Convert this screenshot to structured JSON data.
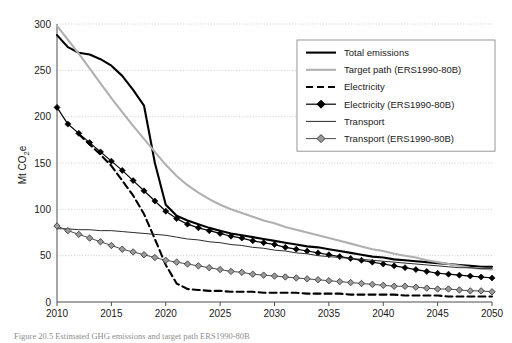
{
  "figure": {
    "caption": "Figure 20.5   Estimated GHG emissions and target path ERS1990-80B"
  },
  "chart_data": {
    "type": "line",
    "title": "",
    "xlabel": "",
    "ylabel": "Mt CO2e",
    "ylabel_display": "Mt CO",
    "ylabel_sub": "2",
    "ylabel_tail": "e",
    "xlim": [
      2010,
      2050
    ],
    "ylim": [
      0,
      300
    ],
    "yticks": [
      0,
      50,
      100,
      150,
      200,
      250,
      300
    ],
    "xticks": [
      2010,
      2015,
      2020,
      2025,
      2030,
      2035,
      2040,
      2045,
      2050
    ],
    "grid": "horizontal-dotted",
    "legend_position": "top-right",
    "colors": {
      "total_emissions": "#000000",
      "target_path": "#b0b0b0",
      "electricity": "#000000",
      "electricity_ers": "#000000",
      "transport": "#2b2b2b",
      "transport_ers": "#808080",
      "gridline": "#bfbfbf",
      "axis": "#4d4d4d",
      "legend_border": "#8c8c8c"
    },
    "series": [
      {
        "name": "Total emissions",
        "style": "solid-thick",
        "color": "#000000",
        "x": [
          2010,
          2011,
          2012,
          2013,
          2014,
          2015,
          2016,
          2017,
          2018,
          2019,
          2020,
          2021,
          2022,
          2023,
          2024,
          2025,
          2026,
          2027,
          2028,
          2029,
          2030,
          2031,
          2032,
          2033,
          2034,
          2035,
          2036,
          2037,
          2038,
          2039,
          2040,
          2041,
          2042,
          2043,
          2044,
          2045,
          2046,
          2047,
          2048,
          2049,
          2050
        ],
        "values": [
          288,
          275,
          269,
          267,
          262,
          255,
          244,
          229,
          212,
          150,
          105,
          93,
          88,
          84,
          80,
          77,
          74,
          72,
          70,
          68,
          66,
          64,
          62,
          60,
          59,
          57,
          55,
          53,
          51,
          49,
          48,
          46,
          45,
          44,
          43,
          42,
          41,
          40,
          39,
          38,
          38
        ]
      },
      {
        "name": "Target path (ERS1990-80B)",
        "style": "solid-thick",
        "color": "#b0b0b0",
        "x": [
          2010,
          2011,
          2012,
          2013,
          2014,
          2015,
          2016,
          2017,
          2018,
          2019,
          2020,
          2021,
          2022,
          2023,
          2024,
          2025,
          2026,
          2027,
          2028,
          2029,
          2030,
          2031,
          2032,
          2033,
          2034,
          2035,
          2036,
          2037,
          2038,
          2039,
          2040,
          2041,
          2042,
          2043,
          2044,
          2045,
          2046,
          2047,
          2048,
          2049,
          2050
        ],
        "values": [
          298,
          283,
          268,
          252,
          236,
          220,
          205,
          190,
          176,
          162,
          148,
          136,
          126,
          118,
          111,
          105,
          100,
          96,
          92,
          88,
          85,
          81,
          78,
          75,
          72,
          69,
          66,
          63,
          60,
          57,
          55,
          52,
          50,
          48,
          45,
          43,
          41,
          39,
          37,
          36,
          35
        ]
      },
      {
        "name": "Electricity",
        "style": "dashed",
        "color": "#000000",
        "x": [
          2012,
          2013,
          2014,
          2015,
          2016,
          2017,
          2018,
          2019,
          2020,
          2021,
          2022,
          2023,
          2024,
          2025,
          2026,
          2027,
          2028,
          2029,
          2030,
          2031,
          2032,
          2033,
          2034,
          2035,
          2036,
          2037,
          2038,
          2039,
          2040,
          2041,
          2042,
          2043,
          2044,
          2045,
          2046,
          2047,
          2048,
          2049,
          2050
        ],
        "values": [
          181,
          170,
          159,
          147,
          131,
          115,
          95,
          68,
          40,
          20,
          14,
          13,
          12,
          12,
          11,
          11,
          11,
          10,
          10,
          10,
          10,
          9,
          9,
          9,
          9,
          8,
          8,
          8,
          8,
          8,
          7,
          7,
          7,
          7,
          6,
          6,
          6,
          6,
          6
        ]
      },
      {
        "name": "Electricity (ERS1990-80B)",
        "style": "solid-marker-diamond-black",
        "color": "#000000",
        "x": [
          2010,
          2011,
          2012,
          2013,
          2014,
          2015,
          2016,
          2017,
          2018,
          2019,
          2020,
          2021,
          2022,
          2023,
          2024,
          2025,
          2026,
          2027,
          2028,
          2029,
          2030,
          2031,
          2032,
          2033,
          2034,
          2035,
          2036,
          2037,
          2038,
          2039,
          2040,
          2041,
          2042,
          2043,
          2044,
          2045,
          2046,
          2047,
          2048,
          2049,
          2050
        ],
        "values": [
          210,
          192,
          182,
          172,
          162,
          152,
          142,
          131,
          120,
          109,
          98,
          90,
          84,
          80,
          77,
          74,
          71,
          69,
          66,
          64,
          62,
          59,
          57,
          55,
          53,
          51,
          49,
          47,
          45,
          43,
          41,
          39,
          37,
          35,
          33,
          31,
          30,
          29,
          28,
          27,
          26
        ]
      },
      {
        "name": "Transport",
        "style": "solid-thin",
        "color": "#2b2b2b",
        "x": [
          2010,
          2011,
          2012,
          2013,
          2014,
          2015,
          2016,
          2017,
          2018,
          2019,
          2020,
          2021,
          2022,
          2023,
          2024,
          2025,
          2026,
          2027,
          2028,
          2029,
          2030,
          2031,
          2032,
          2033,
          2034,
          2035,
          2036,
          2037,
          2038,
          2039,
          2040,
          2041,
          2042,
          2043,
          2044,
          2045,
          2046,
          2047,
          2048,
          2049,
          2050
        ],
        "values": [
          79,
          79,
          78,
          78,
          77,
          77,
          76,
          75,
          74,
          73,
          72,
          70,
          68,
          67,
          65,
          64,
          62,
          61,
          59,
          58,
          56,
          55,
          53,
          52,
          50,
          49,
          48,
          47,
          46,
          45,
          44,
          43,
          42,
          41,
          40,
          39,
          38,
          37,
          37,
          36,
          36
        ]
      },
      {
        "name": "Transport (ERS1990-80B)",
        "style": "solid-marker-diamond-grey",
        "color": "#808080",
        "x": [
          2010,
          2011,
          2012,
          2013,
          2014,
          2015,
          2016,
          2017,
          2018,
          2019,
          2020,
          2021,
          2022,
          2023,
          2024,
          2025,
          2026,
          2027,
          2028,
          2029,
          2030,
          2031,
          2032,
          2033,
          2034,
          2035,
          2036,
          2037,
          2038,
          2039,
          2040,
          2041,
          2042,
          2043,
          2044,
          2045,
          2046,
          2047,
          2048,
          2049,
          2050
        ],
        "values": [
          82,
          77,
          73,
          69,
          65,
          61,
          57,
          54,
          51,
          48,
          45,
          43,
          41,
          39,
          37,
          35,
          33,
          32,
          30,
          29,
          28,
          27,
          26,
          25,
          24,
          23,
          22,
          21,
          20,
          19,
          18,
          17,
          17,
          16,
          15,
          14,
          14,
          13,
          12,
          12,
          11
        ]
      }
    ],
    "legend": [
      {
        "label": "Total emissions",
        "style": "solid-thick",
        "color": "#000000"
      },
      {
        "label": "Target path (ERS1990-80B)",
        "style": "solid-thick",
        "color": "#b0b0b0"
      },
      {
        "label": "Electricity",
        "style": "dashed",
        "color": "#000000"
      },
      {
        "label": "Electricity (ERS1990-80B)",
        "style": "solid-marker-diamond-black",
        "color": "#000000"
      },
      {
        "label": "Transport",
        "style": "solid-thin",
        "color": "#2b2b2b"
      },
      {
        "label": "Transport (ERS1990-80B)",
        "style": "solid-marker-diamond-grey",
        "color": "#808080"
      }
    ]
  }
}
